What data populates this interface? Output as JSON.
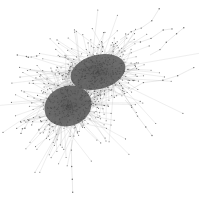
{
  "diagram": {
    "type": "network-graph",
    "background": "#ffffff",
    "edge_color": "#9a9a9a",
    "node_color": "#4a4a4a",
    "core_color": "#555555",
    "clusters": [
      {
        "name": "cluster-upper-right",
        "cx": 98,
        "cy": 72,
        "rx": 28,
        "ry": 17,
        "spread": 40,
        "nodes": 420,
        "angle": -15
      },
      {
        "name": "cluster-lower-left",
        "cx": 68,
        "cy": 106,
        "rx": 24,
        "ry": 20,
        "spread": 38,
        "nodes": 420,
        "angle": -20
      }
    ],
    "tendrils": [
      {
        "from": [
          120,
          40
        ],
        "to": [
          160,
          10
        ]
      },
      {
        "from": [
          128,
          42
        ],
        "to": [
          172,
          30
        ]
      },
      {
        "from": [
          130,
          90
        ],
        "to": [
          193,
          68
        ]
      },
      {
        "from": [
          125,
          100
        ],
        "to": [
          152,
          134
        ]
      },
      {
        "from": [
          72,
          140
        ],
        "to": [
          72,
          192
        ]
      },
      {
        "from": [
          40,
          55
        ],
        "to": [
          18,
          56
        ]
      },
      {
        "from": [
          30,
          118
        ],
        "to": [
          20,
          132
        ]
      },
      {
        "from": [
          150,
          55
        ],
        "to": [
          182,
          30
        ]
      }
    ]
  }
}
